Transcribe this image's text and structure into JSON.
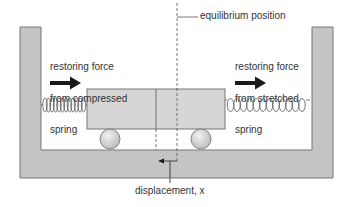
{
  "diagram": {
    "labels": {
      "equilibrium": "equilibrium position",
      "left_force": [
        "restoring force",
        "from compressed",
        "spring"
      ],
      "right_force": [
        "restoring force",
        "from stretched",
        "spring"
      ],
      "displacement": "displacement, x"
    },
    "components": {
      "container": "U-shaped frame with two walls and base",
      "cart": "block mass on two wheels",
      "left_spring": "compressed spring",
      "right_spring": "stretched spring",
      "equilibrium_line": "dashed vertical line",
      "displacement_arrow": "arrow pointing left"
    },
    "colors": {
      "frame_fill": "#c4c4c4",
      "frame_stroke": "#777777",
      "cart_fill": "#d6d6d6",
      "wheel_fill": "#d9d9d9",
      "text": "#333333",
      "arrow": "#1a1a1a"
    }
  }
}
